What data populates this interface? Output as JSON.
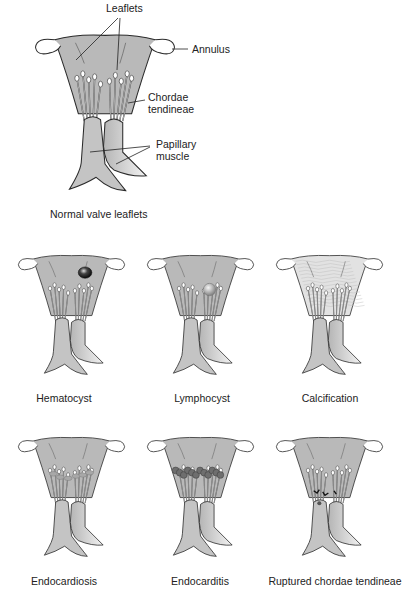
{
  "main_figure": {
    "caption": "Normal valve leaflets",
    "labels": {
      "leaflets": "Leaflets",
      "annulus": "Annulus",
      "chordae_line1": "Chordae",
      "chordae_line2": "tendineae",
      "papillary_line1": "Papillary",
      "papillary_line2": "muscle"
    }
  },
  "panels": [
    {
      "caption": "Hematocyst",
      "condition": "hematocyst"
    },
    {
      "caption": "Lymphocyst",
      "condition": "lymphocyst"
    },
    {
      "caption": "Calcification",
      "condition": "calcification"
    },
    {
      "caption": "Endocardiosis",
      "condition": "endocardiosis"
    },
    {
      "caption": "Endocarditis",
      "condition": "endocarditis"
    },
    {
      "caption": "Ruptured chordae tendineae",
      "condition": "ruptured"
    }
  ],
  "colors": {
    "leaflet_fill": "#b9b9b9",
    "muscle_fill": "#c4c4c4",
    "outline": "#2a2a2a",
    "calcified_fill": "#e2e2e2"
  }
}
